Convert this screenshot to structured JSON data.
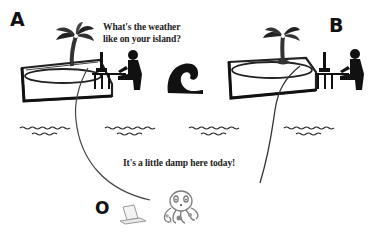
{
  "labels": {
    "panel_a": "A",
    "panel_b": "B",
    "node_o": "O"
  },
  "speech": {
    "question_line1": "What's the weather",
    "question_line2": "like on your island?",
    "answer": "It's a little damp here today!"
  },
  "icons": {
    "island_a": "palm-tree-island-icon",
    "person_a": "person-at-computer-icon",
    "wave": "ocean-wave-icon",
    "island_b": "palm-tree-island-icon",
    "person_b": "person-at-computer-icon",
    "water": "water-ripple-icon",
    "laptop": "laptop-icon",
    "octopus": "octopus-icon"
  },
  "colors": {
    "ink": "#111111",
    "line": "#555555",
    "faint": "#9a9a9a",
    "background": "#ffffff"
  }
}
